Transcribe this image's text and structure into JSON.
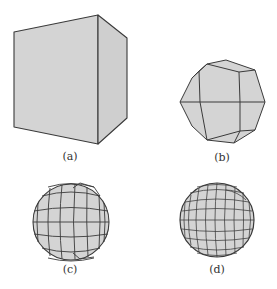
{
  "figure": {
    "panels": [
      {
        "id": "a",
        "label": "(a)",
        "shape": "cube"
      },
      {
        "id": "b",
        "label": "(b)",
        "shape": "subdivided-polyhedron-level-1"
      },
      {
        "id": "c",
        "label": "(c)",
        "shape": "subdivided-sphere-level-2"
      },
      {
        "id": "d",
        "label": "(d)",
        "shape": "subdivided-sphere-level-3"
      }
    ],
    "colors": {
      "fill": "#d4d4d4",
      "stroke": "#3a3a3a",
      "background": "#ffffff"
    }
  }
}
